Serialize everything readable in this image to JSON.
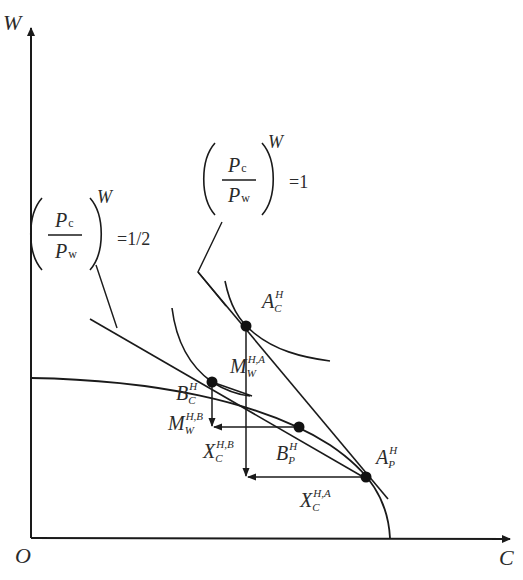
{
  "figure": {
    "type": "trade-diagram"
  },
  "axes": {
    "y_label": "W",
    "x_label": "C",
    "origin_label": "O"
  },
  "price_lines": [
    {
      "id": "ratio-1",
      "numerator": "P",
      "numerator_sub": "c",
      "denominator": "P",
      "denominator_sub": "w",
      "superscript": "W",
      "value": "=1"
    },
    {
      "id": "ratio-half",
      "numerator": "P",
      "numerator_sub": "c",
      "denominator": "P",
      "denominator_sub": "w",
      "superscript": "W",
      "value": "=1/2"
    }
  ],
  "points": {
    "A_C": {
      "base": "A",
      "sup": "H",
      "sub": "C"
    },
    "A_P": {
      "base": "A",
      "sup": "H",
      "sub": "P"
    },
    "B_C": {
      "base": "B",
      "sup": "H",
      "sub": "C"
    },
    "B_P": {
      "base": "B",
      "sup": "H",
      "sub": "P"
    }
  },
  "flows": {
    "M_A": {
      "base": "M",
      "sup": "H,A",
      "sub": "W"
    },
    "M_B": {
      "base": "M",
      "sup": "H,B",
      "sub": "W"
    },
    "X_A": {
      "base": "X",
      "sup": "H,A",
      "sub": "C"
    },
    "X_B": {
      "base": "X",
      "sup": "H,B",
      "sub": "C"
    }
  },
  "colors": {
    "ink": "#1a1a1a",
    "label": "#2a2a2a",
    "background": "#ffffff"
  }
}
